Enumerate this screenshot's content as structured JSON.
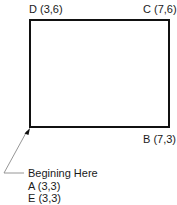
{
  "diagram": {
    "type": "rectangle-with-vertex-labels",
    "rectangle": {
      "stroke_color": "#111111",
      "leader_color": "#8a8a8a"
    },
    "vertices": {
      "D": {
        "label": "D (3,6)",
        "x": 3,
        "y": 6
      },
      "C": {
        "label": "C (7,6)",
        "x": 7,
        "y": 6
      },
      "B": {
        "label": "B (7,3)",
        "x": 7,
        "y": 3
      },
      "A": {
        "label": "A (3,3)",
        "x": 3,
        "y": 3
      },
      "E": {
        "label": "E (3,3)",
        "x": 3,
        "y": 3
      }
    },
    "annotation": {
      "title": "Begining Here",
      "line_a": "A (3,3)",
      "line_e": "E (3,3)"
    }
  }
}
